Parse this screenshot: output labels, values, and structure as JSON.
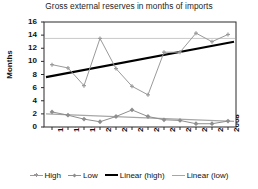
{
  "chart_data": {
    "type": "line",
    "title": "Gross external reserves in months of imports",
    "xlabel": "",
    "ylabel": "Months",
    "categories": [
      "1997",
      "1998",
      "1999",
      "2000",
      "2001",
      "2002",
      "2003",
      "2004",
      "2005",
      "2006",
      "2007",
      "2008"
    ],
    "ylim": [
      0,
      16
    ],
    "yticks": [
      0,
      2,
      4,
      6,
      8,
      10,
      12,
      14,
      16
    ],
    "grid": "horizontal-single",
    "gridline_value": 13.5,
    "legend_position": "bottom",
    "series": [
      {
        "name": "High",
        "type": "line-marker",
        "color": "#9a9a9a",
        "marker": "cross",
        "values": [
          9.5,
          9.0,
          6.3,
          13.5,
          8.9,
          6.2,
          4.9,
          11.4,
          11.4,
          14.3,
          13.0,
          14.1
        ]
      },
      {
        "name": "Low",
        "type": "line-marker",
        "color": "#8e8e8e",
        "marker": "diamond",
        "values": [
          2.3,
          1.8,
          1.2,
          0.8,
          1.6,
          2.6,
          1.6,
          1.1,
          1.0,
          0.5,
          0.5,
          0.9
        ]
      },
      {
        "name": "Linear (high)",
        "type": "trendline",
        "color": "#000000",
        "values": [
          7.6,
          8.09,
          8.58,
          9.07,
          9.56,
          10.05,
          10.55,
          11.04,
          11.53,
          12.02,
          12.51,
          13.0
        ]
      },
      {
        "name": "Linear (low)",
        "type": "trendline",
        "color": "#a6a6a6",
        "values": [
          2.0,
          1.9,
          1.79,
          1.69,
          1.58,
          1.48,
          1.37,
          1.27,
          1.16,
          1.06,
          0.95,
          0.85
        ]
      }
    ]
  },
  "legend": {
    "items": [
      {
        "label": "High",
        "marker": "cross-marker-icon",
        "color": "#9a9a9a"
      },
      {
        "label": "Low",
        "marker": "diamond-marker-icon",
        "color": "#8e8e8e"
      },
      {
        "label": "Linear (high)",
        "marker": "thick-line-icon",
        "color": "#000000"
      },
      {
        "label": "Linear (low)",
        "marker": "thin-line-icon",
        "color": "#a6a6a6"
      }
    ]
  },
  "axes": {
    "y_label": "Months",
    "y_ticks": [
      "16",
      "14",
      "12",
      "10",
      "8",
      "6",
      "4",
      "2",
      "0"
    ],
    "x_ticks": [
      "1997",
      "1998",
      "1999",
      "2000",
      "2001",
      "2002",
      "2003",
      "2004",
      "2005",
      "2006",
      "2007",
      "2008"
    ]
  }
}
